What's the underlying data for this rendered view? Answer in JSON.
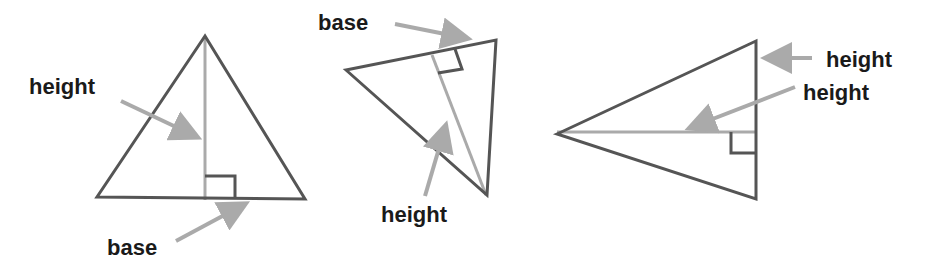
{
  "colors": {
    "edge": "#555555",
    "height_line": "#aaaaaa",
    "arrow": "#aaaaaa",
    "text": "#1a1a1a",
    "background": "#ffffff"
  },
  "diagram": {
    "triangles": [
      {
        "id": "triangle-1",
        "type": "acute",
        "labels": {
          "height": "height",
          "base": "base"
        }
      },
      {
        "id": "triangle-2",
        "type": "rotated",
        "labels": {
          "base": "base",
          "height": "height"
        }
      },
      {
        "id": "triangle-3",
        "type": "pointing-left",
        "labels": {
          "height_side": "height",
          "height_inner": "height"
        }
      }
    ]
  }
}
